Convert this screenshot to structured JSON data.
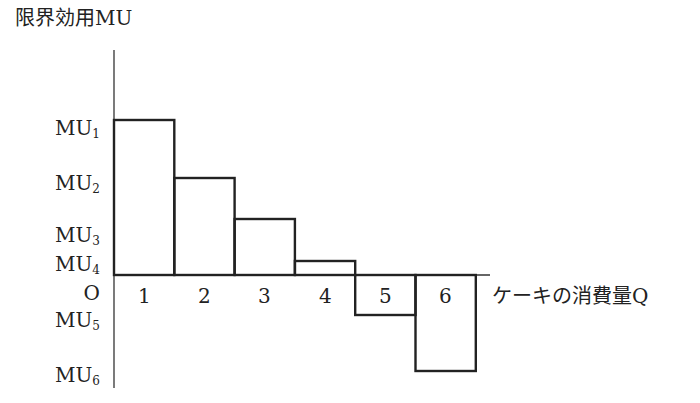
{
  "chart_data": {
    "type": "bar",
    "title": "",
    "ylabel": "限界効用MU",
    "xlabel": "ケーキの消費量Q",
    "origin_label": "O",
    "categories": [
      "1",
      "2",
      "3",
      "4",
      "5",
      "6"
    ],
    "values": [
      155,
      97,
      56,
      14,
      -40,
      -96
    ],
    "y_tick_labels": [
      {
        "base": "MU",
        "sub": "1"
      },
      {
        "base": "MU",
        "sub": "2"
      },
      {
        "base": "MU",
        "sub": "3"
      },
      {
        "base": "MU",
        "sub": "4"
      },
      {
        "base": "MU",
        "sub": "5"
      },
      {
        "base": "MU",
        "sub": "6"
      }
    ],
    "grid": false,
    "legend": null
  }
}
